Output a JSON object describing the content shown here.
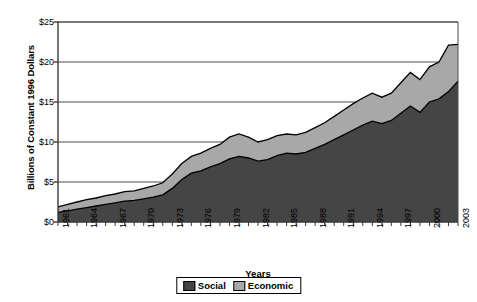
{
  "chart_data": {
    "type": "area",
    "stacked": true,
    "title": "",
    "xlabel": "Years",
    "ylabel": "Billions of Constant 1996 Dollars",
    "ylim": [
      0,
      25
    ],
    "ytick_labels": [
      "$0",
      "$5",
      "$10",
      "$15",
      "$20",
      "$25"
    ],
    "ytick_values": [
      0,
      5,
      10,
      15,
      20,
      25
    ],
    "grid": true,
    "legend_position": "bottom",
    "x": [
      1961,
      1962,
      1963,
      1964,
      1965,
      1966,
      1967,
      1968,
      1969,
      1970,
      1971,
      1972,
      1973,
      1974,
      1975,
      1976,
      1977,
      1978,
      1979,
      1980,
      1981,
      1982,
      1983,
      1984,
      1985,
      1986,
      1987,
      1988,
      1989,
      1990,
      1991,
      1992,
      1993,
      1994,
      1995,
      1996,
      1997,
      1998,
      1999,
      2000,
      2001,
      2002,
      2003
    ],
    "xtick_labels": [
      "1961",
      "1964",
      "1967",
      "1970",
      "1973",
      "1976",
      "1979",
      "1982",
      "1985",
      "1988",
      "1991",
      "1994",
      "1997",
      "2000",
      "2003"
    ],
    "series": [
      {
        "name": "Social",
        "color": "#454545",
        "values": [
          1.2,
          1.4,
          1.6,
          1.8,
          2.0,
          2.2,
          2.4,
          2.6,
          2.7,
          2.9,
          3.1,
          3.4,
          4.2,
          5.3,
          6.1,
          6.4,
          6.9,
          7.3,
          7.9,
          8.2,
          8.0,
          7.6,
          7.8,
          8.3,
          8.6,
          8.5,
          8.7,
          9.2,
          9.7,
          10.3,
          10.9,
          11.5,
          12.1,
          12.6,
          12.3,
          12.7,
          13.6,
          14.5,
          13.7,
          15.0,
          15.4,
          16.3,
          17.6
        ]
      },
      {
        "name": "Economic",
        "color": "#a8a8a8",
        "values": [
          0.7,
          0.8,
          0.9,
          1.0,
          1.0,
          1.1,
          1.1,
          1.2,
          1.2,
          1.3,
          1.4,
          1.5,
          1.8,
          2.0,
          2.1,
          2.2,
          2.3,
          2.4,
          2.7,
          2.8,
          2.6,
          2.4,
          2.5,
          2.5,
          2.4,
          2.4,
          2.5,
          2.6,
          2.7,
          2.9,
          3.1,
          3.3,
          3.4,
          3.5,
          3.3,
          3.4,
          3.8,
          4.2,
          4.1,
          4.4,
          4.6,
          5.8,
          4.6
        ]
      }
    ],
    "totals": [
      1.9,
      2.2,
      2.5,
      2.8,
      3.0,
      3.3,
      3.5,
      3.8,
      3.9,
      4.2,
      4.5,
      4.9,
      6.0,
      7.3,
      8.2,
      8.6,
      9.2,
      9.7,
      10.6,
      11.0,
      10.6,
      10.0,
      10.3,
      10.8,
      11.0,
      10.9,
      11.2,
      11.8,
      12.4,
      13.2,
      14.0,
      14.8,
      15.5,
      16.1,
      15.6,
      16.1,
      17.4,
      18.7,
      17.8,
      19.4,
      20.0,
      22.1,
      22.2
    ]
  },
  "legend": {
    "items": [
      {
        "label": "Social",
        "color": "#454545"
      },
      {
        "label": "Economic",
        "color": "#a8a8a8"
      }
    ]
  },
  "axes": {
    "y_title": "Billions of Constant 1996 Dollars",
    "x_title": "Years"
  }
}
